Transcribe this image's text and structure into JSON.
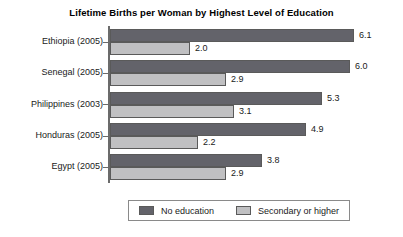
{
  "chart_data": {
    "type": "bar",
    "orientation": "horizontal",
    "title": "Lifetime Births per Woman by Highest Level of Education",
    "xlabel": "",
    "ylabel": "",
    "xlim": [
      0,
      7
    ],
    "grid": false,
    "legend_position": "bottom",
    "categories": [
      "Ethiopia (2005)",
      "Senegal (2005)",
      "Philippines (2003)",
      "Honduras (2005)",
      "Egypt (2005)"
    ],
    "series": [
      {
        "name": "No education",
        "color": "#63636a",
        "values": [
          6.1,
          6.0,
          5.3,
          4.9,
          3.8
        ],
        "labels": [
          "6.1",
          "6.0",
          "5.3",
          "4.9",
          "3.8"
        ]
      },
      {
        "name": "Secondary or higher",
        "color": "#c0c0c2",
        "values": [
          2.0,
          2.9,
          3.1,
          2.2,
          2.9
        ],
        "labels": [
          "2.0",
          "2.9",
          "3.1",
          "2.2",
          "2.9"
        ]
      }
    ]
  },
  "legend": {
    "entries": [
      {
        "label": "No education"
      },
      {
        "label": "Secondary or higher"
      }
    ]
  }
}
